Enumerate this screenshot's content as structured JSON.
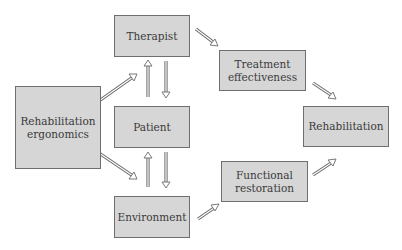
{
  "diagram": {
    "nodes": [
      {
        "id": "therapist",
        "label": "Therapist"
      },
      {
        "id": "rehab_ergonomics",
        "label": "Rehabilitation\nergonomics"
      },
      {
        "id": "patient",
        "label": "Patient"
      },
      {
        "id": "environment",
        "label": "Environment"
      },
      {
        "id": "treatment_effectiveness",
        "label": "Treatment\neffectiveness"
      },
      {
        "id": "functional_restoration",
        "label": "Functional\nrestoration"
      },
      {
        "id": "rehabilitation",
        "label": "Rehabilitation"
      }
    ],
    "edges": [
      {
        "from": "rehab_ergonomics",
        "to": "therapist"
      },
      {
        "from": "rehab_ergonomics",
        "to": "environment"
      },
      {
        "from": "patient",
        "to": "therapist"
      },
      {
        "from": "therapist",
        "to": "patient"
      },
      {
        "from": "environment",
        "to": "patient"
      },
      {
        "from": "patient",
        "to": "environment"
      },
      {
        "from": "therapist",
        "to": "treatment_effectiveness"
      },
      {
        "from": "environment",
        "to": "functional_restoration"
      },
      {
        "from": "treatment_effectiveness",
        "to": "rehabilitation"
      },
      {
        "from": "functional_restoration",
        "to": "rehabilitation"
      }
    ],
    "colors": {
      "box_fill": "#d6d6d6",
      "box_border": "#6e6e6e",
      "arrow": "#7a7a7a",
      "text": "#3a3a3a"
    }
  }
}
